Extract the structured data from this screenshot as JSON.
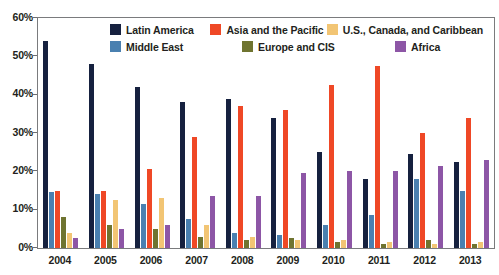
{
  "chart_data": {
    "type": "bar",
    "title": "",
    "xlabel": "",
    "ylabel": "",
    "ylim": [
      0,
      60
    ],
    "ytick_labels": [
      "0%",
      "10%",
      "20%",
      "30%",
      "40%",
      "50%",
      "60%"
    ],
    "ytick_values": [
      0,
      10,
      20,
      30,
      40,
      50,
      60
    ],
    "grid": false,
    "legend_position": "top-center",
    "categories": [
      "2004",
      "2005",
      "2006",
      "2007",
      "2008",
      "2009",
      "2010",
      "2011",
      "2012",
      "2013"
    ],
    "series": [
      {
        "name": "Latin America",
        "color": "#16213f",
        "values": [
          54,
          48,
          42,
          38,
          39,
          34,
          25,
          18,
          24.5,
          22.5
        ]
      },
      {
        "name": "Middle East",
        "color": "#4a80b0",
        "values": [
          14.5,
          14,
          11.5,
          7.5,
          4,
          3.5,
          6,
          8.5,
          18,
          15
        ]
      },
      {
        "name": "Asia and the Pacific",
        "color": "#ef4826",
        "values": [
          15,
          15,
          20.5,
          29,
          37,
          36,
          42.5,
          47.5,
          30,
          34
        ]
      },
      {
        "name": "Europe and CIS",
        "color": "#6f7430",
        "values": [
          8,
          6,
          5,
          3,
          2,
          2.5,
          1.5,
          1,
          2,
          1
        ]
      },
      {
        "name": "U.S., Canada, and Caribbean",
        "color": "#f2c574",
        "values": [
          4,
          12.5,
          13,
          6,
          3,
          2,
          2,
          1.5,
          1,
          1.5
        ]
      },
      {
        "name": "Africa",
        "color": "#8d56a6",
        "values": [
          2.5,
          5,
          6,
          13.5,
          13.5,
          19.5,
          20,
          20,
          21.5,
          23
        ]
      }
    ]
  },
  "legend": {
    "rows": [
      [
        {
          "label": "Latin America",
          "color": "#16213f"
        },
        {
          "label": "Asia and the Pacific",
          "color": "#ef4826"
        },
        {
          "label": "U.S., Canada, and Caribbean",
          "color": "#f2c574"
        }
      ],
      [
        {
          "label": "Middle East",
          "color": "#4a80b0"
        },
        {
          "label": "Europe and CIS",
          "color": "#6f7430"
        },
        {
          "label": "Africa",
          "color": "#8d56a6"
        }
      ]
    ]
  }
}
